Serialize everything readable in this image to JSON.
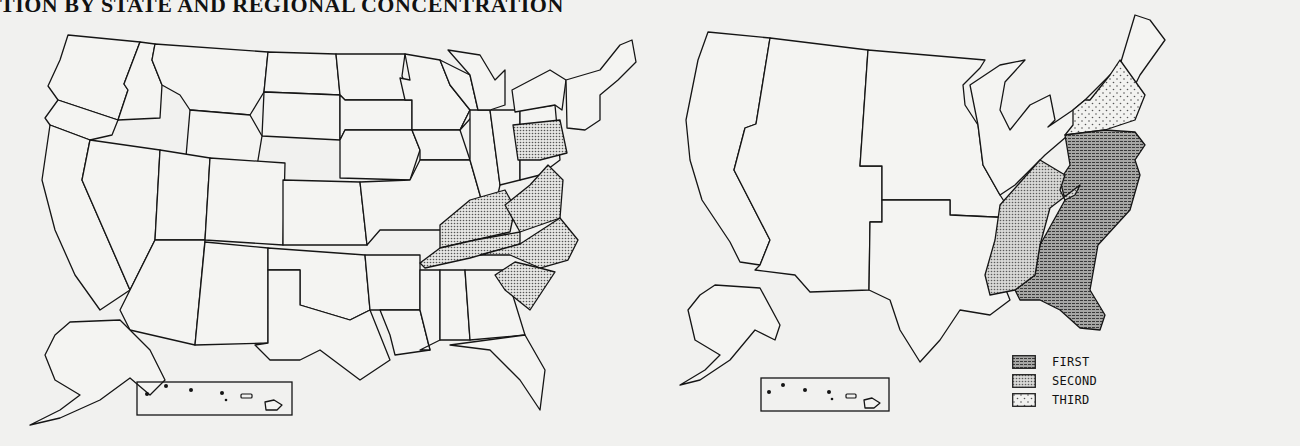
{
  "title": "TION BY STATE AND REGIONAL CONCENTRATION",
  "maps": {
    "left": {
      "description": "State-level map of contiguous U.S., Alaska and Hawaii inset",
      "highlighted_states": [
        "Pennsylvania",
        "Kentucky",
        "Tennessee",
        "Virginia",
        "North Carolina",
        "South Carolina"
      ],
      "highlight_pattern": "dotted-gray"
    },
    "right": {
      "description": "Regional concentration map",
      "regions": [
        {
          "rank": "FIRST",
          "area": "Mid-Atlantic & South Atlantic",
          "pattern": "dark-crosshatch"
        },
        {
          "rank": "SECOND",
          "area": "East South Central",
          "pattern": "dense-dots"
        },
        {
          "rank": "THIRD",
          "area": "New York / New England (southern)",
          "pattern": "sparse-dots"
        }
      ]
    }
  },
  "legend": {
    "items": [
      {
        "label": "FIRST",
        "color": "#8d8d8d"
      },
      {
        "label": "SECOND",
        "color": "#bdbdbd"
      },
      {
        "label": "THIRD",
        "color": "#ececec"
      }
    ]
  },
  "colors": {
    "background": "#f1f1ef",
    "outline": "#151515"
  }
}
